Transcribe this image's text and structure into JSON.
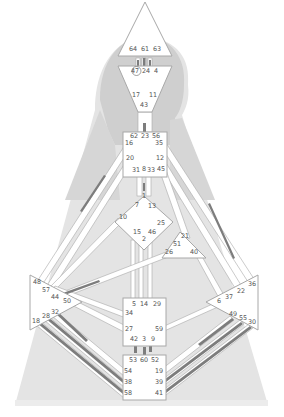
{
  "diagram": {
    "type": "human-design-bodygraph",
    "colors": {
      "background": "#ffffff",
      "silhouette_light": "#e4e4e4",
      "silhouette_mid": "#d2d2d2",
      "silhouette_dark": "#c4c4c4",
      "center_fill": "#ffffff",
      "center_stroke": "#a8a8a8",
      "channel_fill": "#ffffff",
      "channel_active": "#7d7d7d",
      "gate_text": "#555555"
    },
    "centers": [
      {
        "name": "head",
        "shape": "triangle-up",
        "gates": [
          "64",
          "61",
          "63"
        ]
      },
      {
        "name": "ajna",
        "shape": "triangle-down",
        "gates": [
          "47",
          "24",
          "4",
          "17",
          "11",
          "43"
        ],
        "circled_gate": "47"
      },
      {
        "name": "throat",
        "shape": "square",
        "gates": [
          "62",
          "23",
          "56",
          "16",
          "35",
          "20",
          "12",
          "31",
          "8",
          "33",
          "45"
        ]
      },
      {
        "name": "g-center",
        "shape": "diamond",
        "gates": [
          "1",
          "7",
          "13",
          "10",
          "25",
          "15",
          "46",
          "2"
        ]
      },
      {
        "name": "heart",
        "shape": "triangle",
        "gates": [
          "21",
          "51",
          "26",
          "40"
        ]
      },
      {
        "name": "spleen",
        "shape": "triangle-right",
        "gates": [
          "48",
          "57",
          "44",
          "50",
          "32",
          "28",
          "18"
        ]
      },
      {
        "name": "solar-plexus",
        "shape": "triangle-left",
        "gates": [
          "36",
          "22",
          "37",
          "6",
          "49",
          "55",
          "30"
        ]
      },
      {
        "name": "sacral",
        "shape": "square",
        "gates": [
          "5",
          "14",
          "29",
          "34",
          "27",
          "59",
          "42",
          "3",
          "9"
        ]
      },
      {
        "name": "root",
        "shape": "square",
        "gates": [
          "53",
          "60",
          "52",
          "54",
          "19",
          "38",
          "39",
          "58",
          "41"
        ]
      }
    ],
    "gate_labels": [
      {
        "id": "64",
        "x": 133,
        "y": 51
      },
      {
        "id": "61",
        "x": 145,
        "y": 51
      },
      {
        "id": "63",
        "x": 157,
        "y": 51
      },
      {
        "id": "47",
        "x": 135,
        "y": 73
      },
      {
        "id": "24",
        "x": 146,
        "y": 73
      },
      {
        "id": "4",
        "x": 156,
        "y": 73
      },
      {
        "id": "17",
        "x": 136,
        "y": 97
      },
      {
        "id": "11",
        "x": 153,
        "y": 97
      },
      {
        "id": "43",
        "x": 144,
        "y": 107
      },
      {
        "id": "62",
        "x": 134,
        "y": 138
      },
      {
        "id": "23",
        "x": 145,
        "y": 138
      },
      {
        "id": "56",
        "x": 156,
        "y": 138
      },
      {
        "id": "16",
        "x": 129,
        "y": 145
      },
      {
        "id": "35",
        "x": 159,
        "y": 145
      },
      {
        "id": "20",
        "x": 130,
        "y": 160
      },
      {
        "id": "12",
        "x": 160,
        "y": 160
      },
      {
        "id": "31",
        "x": 136,
        "y": 172
      },
      {
        "id": "8",
        "x": 144,
        "y": 171
      },
      {
        "id": "33",
        "x": 151,
        "y": 172
      },
      {
        "id": "45",
        "x": 161,
        "y": 171
      },
      {
        "id": "1",
        "x": 144,
        "y": 198
      },
      {
        "id": "7",
        "x": 137,
        "y": 207
      },
      {
        "id": "13",
        "x": 152,
        "y": 208
      },
      {
        "id": "10",
        "x": 123,
        "y": 219
      },
      {
        "id": "25",
        "x": 161,
        "y": 225
      },
      {
        "id": "15",
        "x": 137,
        "y": 234
      },
      {
        "id": "46",
        "x": 152,
        "y": 234
      },
      {
        "id": "2",
        "x": 144,
        "y": 241
      },
      {
        "id": "21",
        "x": 185,
        "y": 238
      },
      {
        "id": "51",
        "x": 177,
        "y": 246
      },
      {
        "id": "26",
        "x": 169,
        "y": 254
      },
      {
        "id": "40",
        "x": 194,
        "y": 254
      },
      {
        "id": "48",
        "x": 37,
        "y": 284
      },
      {
        "id": "57",
        "x": 46,
        "y": 292
      },
      {
        "id": "44",
        "x": 55,
        "y": 299
      },
      {
        "id": "50",
        "x": 67,
        "y": 303
      },
      {
        "id": "32",
        "x": 55,
        "y": 314
      },
      {
        "id": "28",
        "x": 46,
        "y": 318
      },
      {
        "id": "18",
        "x": 36,
        "y": 323
      },
      {
        "id": "36",
        "x": 252,
        "y": 286
      },
      {
        "id": "22",
        "x": 241,
        "y": 293
      },
      {
        "id": "37",
        "x": 229,
        "y": 299
      },
      {
        "id": "6",
        "x": 219,
        "y": 303
      },
      {
        "id": "49",
        "x": 233,
        "y": 316
      },
      {
        "id": "55",
        "x": 243,
        "y": 320
      },
      {
        "id": "30",
        "x": 252,
        "y": 324
      },
      {
        "id": "5",
        "x": 134,
        "y": 306
      },
      {
        "id": "14",
        "x": 144,
        "y": 306
      },
      {
        "id": "29",
        "x": 157,
        "y": 306
      },
      {
        "id": "34",
        "x": 129,
        "y": 315
      },
      {
        "id": "27",
        "x": 129,
        "y": 331
      },
      {
        "id": "59",
        "x": 159,
        "y": 331
      },
      {
        "id": "42",
        "x": 134,
        "y": 341
      },
      {
        "id": "3",
        "x": 144,
        "y": 341
      },
      {
        "id": "9",
        "x": 153,
        "y": 341
      },
      {
        "id": "53",
        "x": 133,
        "y": 362
      },
      {
        "id": "60",
        "x": 144,
        "y": 362
      },
      {
        "id": "52",
        "x": 155,
        "y": 362
      },
      {
        "id": "54",
        "x": 128,
        "y": 373
      },
      {
        "id": "19",
        "x": 159,
        "y": 373
      },
      {
        "id": "38",
        "x": 128,
        "y": 384
      },
      {
        "id": "39",
        "x": 159,
        "y": 384
      },
      {
        "id": "58",
        "x": 128,
        "y": 395
      },
      {
        "id": "41",
        "x": 159,
        "y": 395
      }
    ],
    "active_channels_visual": [
      "head-ajna (64-47, 61-24, 63-4)",
      "ajna-throat (43-23)",
      "throat-g (8-1)",
      "sacral-root (42-53, 3-60)",
      "throat-spleen (16-48 / 20-57 line)",
      "throat-solar-plexus (35-36 / 12-22 line)",
      "spleen-sacral (57-34)",
      "spleen-root (32-54, 28-38, 18-58)",
      "solar-plexus-root (49-19, 55-39, 30-41)"
    ]
  }
}
